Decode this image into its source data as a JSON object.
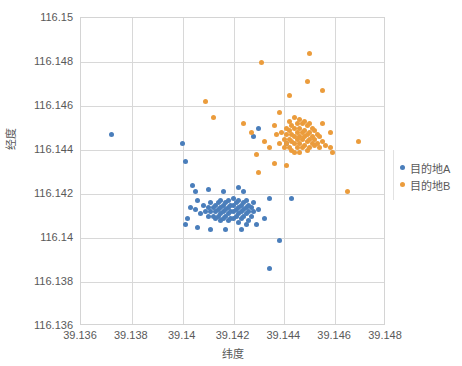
{
  "chart_data": {
    "type": "scatter",
    "title": "",
    "xlabel": "纬度",
    "ylabel": "经度",
    "xlim": [
      39.136,
      39.148
    ],
    "ylim": [
      116.136,
      116.15
    ],
    "xticks": [
      "39.136",
      "39.138",
      "39.14",
      "39.142",
      "39.144",
      "39.146",
      "39.148"
    ],
    "yticks": [
      "116.136",
      "116.138",
      "116.14",
      "116.142",
      "116.144",
      "116.146",
      "116.148",
      "116.15"
    ],
    "grid": true,
    "legend_position": "right",
    "colors": {
      "destination_a": "#4a7ebb",
      "destination_b": "#eb9c3c",
      "gridline": "#d8d8d8",
      "axis_text": "#595959"
    },
    "series": [
      {
        "name": "目的地A",
        "color": "#4a7ebb",
        "points": [
          [
            39.1372,
            116.1447
          ],
          [
            39.14,
            116.1443
          ],
          [
            39.1401,
            116.1435
          ],
          [
            39.1404,
            116.1424
          ],
          [
            39.143,
            116.145
          ],
          [
            39.1428,
            116.1446
          ],
          [
            39.141,
            116.1422
          ],
          [
            39.1416,
            116.1421
          ],
          [
            39.1422,
            116.1423
          ],
          [
            39.1424,
            116.1421
          ],
          [
            39.1403,
            116.1414
          ],
          [
            39.1405,
            116.1413
          ],
          [
            39.1406,
            116.1417
          ],
          [
            39.1407,
            116.1411
          ],
          [
            39.1408,
            116.1415
          ],
          [
            39.1409,
            116.1412
          ],
          [
            39.141,
            116.1414
          ],
          [
            39.141,
            116.141
          ],
          [
            39.1411,
            116.1416
          ],
          [
            39.1411,
            116.1412
          ],
          [
            39.1412,
            116.1414
          ],
          [
            39.1412,
            116.141
          ],
          [
            39.1413,
            116.1415
          ],
          [
            39.1413,
            116.1412
          ],
          [
            39.1413,
            116.1409
          ],
          [
            39.1414,
            116.1416
          ],
          [
            39.1414,
            116.1413
          ],
          [
            39.1414,
            116.141
          ],
          [
            39.1415,
            116.1417
          ],
          [
            39.1415,
            116.1414
          ],
          [
            39.1415,
            116.1411
          ],
          [
            39.1415,
            116.1408
          ],
          [
            39.1416,
            116.1415
          ],
          [
            39.1416,
            116.1412
          ],
          [
            39.1416,
            116.1409
          ],
          [
            39.1417,
            116.1416
          ],
          [
            39.1417,
            116.1413
          ],
          [
            39.1417,
            116.141
          ],
          [
            39.1418,
            116.1417
          ],
          [
            39.1418,
            116.1414
          ],
          [
            39.1418,
            116.1411
          ],
          [
            39.1418,
            116.1408
          ],
          [
            39.1419,
            116.1415
          ],
          [
            39.1419,
            116.1412
          ],
          [
            39.1419,
            116.1409
          ],
          [
            39.142,
            116.1418
          ],
          [
            39.142,
            116.1415
          ],
          [
            39.142,
            116.1412
          ],
          [
            39.142,
            116.1409
          ],
          [
            39.1421,
            116.1416
          ],
          [
            39.1421,
            116.1413
          ],
          [
            39.1421,
            116.141
          ],
          [
            39.1422,
            116.1417
          ],
          [
            39.1422,
            116.1414
          ],
          [
            39.1422,
            116.1411
          ],
          [
            39.1422,
            116.1407
          ],
          [
            39.1423,
            116.1415
          ],
          [
            39.1423,
            116.1412
          ],
          [
            39.1423,
            116.1409
          ],
          [
            39.1424,
            116.1416
          ],
          [
            39.1424,
            116.1413
          ],
          [
            39.1424,
            116.141
          ],
          [
            39.1425,
            116.1417
          ],
          [
            39.1425,
            116.1414
          ],
          [
            39.1425,
            116.1411
          ],
          [
            39.1425,
            116.1406
          ],
          [
            39.1426,
            116.1415
          ],
          [
            39.1426,
            116.1412
          ],
          [
            39.1426,
            116.1408
          ],
          [
            39.1427,
            116.1414
          ],
          [
            39.1427,
            116.141
          ],
          [
            39.1428,
            116.1416
          ],
          [
            39.1428,
            116.1412
          ],
          [
            39.1429,
            116.1406
          ],
          [
            39.143,
            116.1413
          ],
          [
            39.1406,
            116.1405
          ],
          [
            39.1411,
            116.1404
          ],
          [
            39.1417,
            116.1404
          ],
          [
            39.1423,
            116.1404
          ],
          [
            39.1402,
            116.1409
          ],
          [
            39.1401,
            116.1406
          ],
          [
            39.1432,
            116.1409
          ],
          [
            39.1405,
            116.1421
          ],
          [
            39.1434,
            116.1418
          ],
          [
            39.1438,
            116.1399
          ],
          [
            39.1443,
            116.1418
          ],
          [
            39.1434,
            116.1386
          ],
          [
            39.1441,
            116.1443
          ]
        ]
      },
      {
        "name": "目的地B",
        "color": "#eb9c3c",
        "points": [
          [
            39.1409,
            116.1462
          ],
          [
            39.1412,
            116.1455
          ],
          [
            39.1431,
            116.148
          ],
          [
            39.1449,
            116.1471
          ],
          [
            39.1442,
            116.1465
          ],
          [
            39.145,
            116.1484
          ],
          [
            39.1455,
            116.1467
          ],
          [
            39.1469,
            116.1444
          ],
          [
            39.1465,
            116.1421
          ],
          [
            39.1424,
            116.1452
          ],
          [
            39.1427,
            116.1448
          ],
          [
            39.1432,
            116.1444
          ],
          [
            39.1429,
            116.1438
          ],
          [
            39.1436,
            116.1451
          ],
          [
            39.1437,
            116.1447
          ],
          [
            39.1438,
            116.1443
          ],
          [
            39.1439,
            116.1448
          ],
          [
            39.144,
            116.1445
          ],
          [
            39.144,
            116.1441
          ],
          [
            39.1441,
            116.145
          ],
          [
            39.1441,
            116.1447
          ],
          [
            39.1441,
            116.1443
          ],
          [
            39.1442,
            116.1453
          ],
          [
            39.1442,
            116.1449
          ],
          [
            39.1442,
            116.1445
          ],
          [
            39.1442,
            116.1441
          ],
          [
            39.1443,
            116.1451
          ],
          [
            39.1443,
            116.1447
          ],
          [
            39.1443,
            116.1444
          ],
          [
            39.1443,
            116.144
          ],
          [
            39.1444,
            116.1455
          ],
          [
            39.1444,
            116.145
          ],
          [
            39.1444,
            116.1446
          ],
          [
            39.1444,
            116.1443
          ],
          [
            39.1444,
            116.1439
          ],
          [
            39.1445,
            116.1452
          ],
          [
            39.1445,
            116.1448
          ],
          [
            39.1445,
            116.1445
          ],
          [
            39.1445,
            116.1441
          ],
          [
            39.1446,
            116.1454
          ],
          [
            39.1446,
            116.145
          ],
          [
            39.1446,
            116.1446
          ],
          [
            39.1446,
            116.1443
          ],
          [
            39.1446,
            116.1439
          ],
          [
            39.1447,
            116.1452
          ],
          [
            39.1447,
            116.1448
          ],
          [
            39.1447,
            116.1445
          ],
          [
            39.1447,
            116.1441
          ],
          [
            39.1448,
            116.1453
          ],
          [
            39.1448,
            116.1449
          ],
          [
            39.1448,
            116.1446
          ],
          [
            39.1448,
            116.1442
          ],
          [
            39.1449,
            116.1451
          ],
          [
            39.1449,
            116.1447
          ],
          [
            39.1449,
            116.1444
          ],
          [
            39.1449,
            116.144
          ],
          [
            39.145,
            116.1452
          ],
          [
            39.145,
            116.1448
          ],
          [
            39.145,
            116.1445
          ],
          [
            39.145,
            116.1441
          ],
          [
            39.1451,
            116.145
          ],
          [
            39.1451,
            116.1446
          ],
          [
            39.1451,
            116.1443
          ],
          [
            39.1452,
            116.1449
          ],
          [
            39.1452,
            116.1445
          ],
          [
            39.1452,
            116.1442
          ],
          [
            39.1453,
            116.1447
          ],
          [
            39.1453,
            116.1443
          ],
          [
            39.1454,
            116.1446
          ],
          [
            39.1454,
            116.1441
          ],
          [
            39.1455,
            116.1444
          ],
          [
            39.1456,
            116.1442
          ],
          [
            39.1458,
            116.1441
          ],
          [
            39.1459,
            116.1439
          ],
          [
            39.1436,
            116.1434
          ],
          [
            39.1441,
            116.1433
          ],
          [
            39.1438,
            116.1457
          ],
          [
            39.1434,
            116.1441
          ],
          [
            39.143,
            116.143
          ],
          [
            39.1455,
            116.1452
          ],
          [
            39.1458,
            116.1448
          ]
        ]
      }
    ]
  },
  "legend": {
    "items": [
      {
        "label": "目的地A",
        "color": "#4a7ebb"
      },
      {
        "label": "目的地B",
        "color": "#eb9c3c"
      }
    ]
  }
}
